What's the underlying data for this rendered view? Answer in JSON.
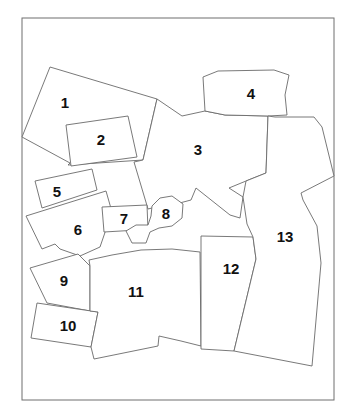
{
  "map": {
    "width": 354,
    "height": 420,
    "frame": {
      "x": 22,
      "y": 18,
      "w": 312,
      "h": 382
    },
    "colors": {
      "stroke": "#6a6a6a",
      "fill": "#ffffff",
      "label": "#111111"
    },
    "regions": [
      {
        "id": "1",
        "label": "1",
        "lx": 65,
        "ly": 104,
        "points": "22,137 50,67 157,99 143,160 68,165 70,163 22,137"
      },
      {
        "id": "2",
        "label": "2",
        "lx": 101,
        "ly": 141,
        "points": "66,125 128,116 137,157 71,166"
      },
      {
        "id": "3",
        "label": "3",
        "lx": 198,
        "ly": 151,
        "points": "157,99 182,116 205,111 225,115 268,116 266,173 246,181 229,188 243,197 240,218 230,215 196,188 191,200 172,205 160,206 148,209 134,162 143,160"
      },
      {
        "id": "4",
        "label": "4",
        "lx": 251,
        "ly": 95,
        "points": "203,77 218,71 274,70 289,75 285,95 287,115 268,116 225,115 205,111"
      },
      {
        "id": "5",
        "label": "5",
        "lx": 57,
        "ly": 193,
        "points": "35,181 92,169 97,190 42,208"
      },
      {
        "id": "6",
        "label": "6",
        "lx": 78,
        "ly": 231,
        "points": "26,216 106,191 112,212 100,247 80,256 60,249 55,244 42,249"
      },
      {
        "id": "7",
        "label": "7",
        "lx": 124,
        "ly": 220,
        "points": "102,207 147,205 148,230 138,230 104,232"
      },
      {
        "id": "8",
        "label": "8",
        "lx": 166,
        "ly": 215,
        "points": "152,206 160,198 172,196 183,204 182,218 172,226 159,228 150,232 146,243 132,243 126,231 136,225 148,225 151,216"
      },
      {
        "id": "9",
        "label": "9",
        "lx": 64,
        "ly": 282,
        "points": "30,268 78,254 90,266 90,311 47,303"
      },
      {
        "id": "10",
        "label": "10",
        "lx": 68,
        "ly": 327,
        "points": "37,303 98,312 91,347 31,338"
      },
      {
        "id": "11",
        "label": "11",
        "lx": 136,
        "ly": 293,
        "points": "89,260 112,255 141,250 172,249 200,252 201,346 181,341 159,336 158,346 94,359 91,347 98,312 90,311 90,266"
      },
      {
        "id": "12",
        "label": "12",
        "lx": 231,
        "ly": 270,
        "points": "201,236 253,237 256,259 234,351 201,349"
      },
      {
        "id": "13",
        "label": "13",
        "lx": 285,
        "ly": 238,
        "points": "243,197 246,181 266,173 268,116 275,117 314,117 322,127 334,176 301,193 303,200 317,226 321,263 312,366 234,351 256,259 253,237 247,224"
      }
    ]
  }
}
